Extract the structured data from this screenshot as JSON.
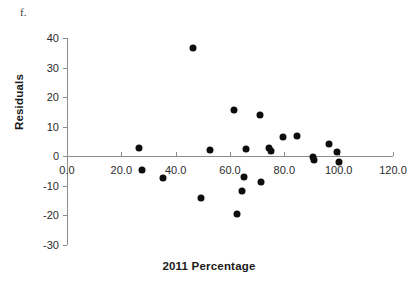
{
  "panel": {
    "label": "f."
  },
  "chart_data": {
    "type": "scatter",
    "title": "",
    "xlabel": "2011 Percentage",
    "ylabel": "Residuals",
    "xlim": [
      0,
      120
    ],
    "ylim": [
      -30,
      40
    ],
    "grid": false,
    "legend": "none",
    "xticks": [
      "0.0",
      "20.0",
      "40.0",
      "60.0",
      "80.0",
      "100.0",
      "120.0"
    ],
    "xtick_values": [
      0,
      20,
      40,
      60,
      80,
      100,
      120
    ],
    "yticks": [
      "40",
      "30",
      "20",
      "10",
      "0",
      "-10",
      "-20",
      "-30"
    ],
    "ytick_values": [
      40,
      30,
      20,
      10,
      0,
      -10,
      -20,
      -30
    ],
    "zero_line": 0,
    "marker": "filled-circle",
    "marker_color": "#0d0d0d",
    "axis_color": "#8c8c8c",
    "points": [
      {
        "x": 26.5,
        "y": 2.8
      },
      {
        "x": 27.5,
        "y": -4.7
      },
      {
        "x": 35.5,
        "y": -7.2
      },
      {
        "x": 46.5,
        "y": 36.5
      },
      {
        "x": 49.5,
        "y": -14.2
      },
      {
        "x": 52.5,
        "y": 2.0
      },
      {
        "x": 61.5,
        "y": 15.5
      },
      {
        "x": 62.5,
        "y": -19.6
      },
      {
        "x": 64.5,
        "y": -11.6
      },
      {
        "x": 65.0,
        "y": -6.9
      },
      {
        "x": 66.0,
        "y": 2.5
      },
      {
        "x": 71.0,
        "y": 14.1
      },
      {
        "x": 71.5,
        "y": -8.7
      },
      {
        "x": 74.5,
        "y": 2.8
      },
      {
        "x": 75.0,
        "y": 1.8
      },
      {
        "x": 79.5,
        "y": 6.4
      },
      {
        "x": 84.5,
        "y": 6.8
      },
      {
        "x": 90.5,
        "y": -0.3
      },
      {
        "x": 91.0,
        "y": -1.4
      },
      {
        "x": 96.5,
        "y": 4.2
      },
      {
        "x": 99.5,
        "y": 1.4
      },
      {
        "x": 100.0,
        "y": -1.9
      }
    ]
  }
}
